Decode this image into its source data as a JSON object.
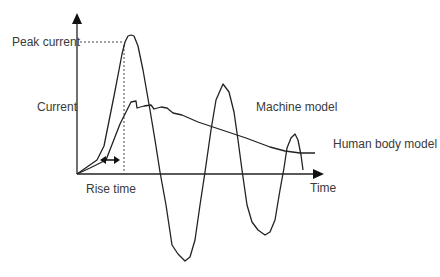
{
  "diagram": {
    "labels": {
      "peak_current": "Peak current",
      "current": "Current",
      "rise_time": "Rise time",
      "time": "Time",
      "machine_model": "Machine model",
      "human_body_model": "Human body model"
    },
    "colors": {
      "line": "#222222",
      "text": "#3a3a3a",
      "background": "#ffffff"
    }
  }
}
